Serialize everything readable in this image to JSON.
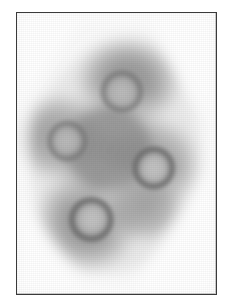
{
  "figure": {
    "domain": "micrograph",
    "caption": "",
    "width": 231,
    "height": 306,
    "page_background": "#ffffff"
  },
  "frame": {
    "border_color": "#3a3a3a",
    "border_width": 1,
    "x": 16,
    "y": 12,
    "width": 201,
    "height": 283,
    "plate_background": "#fafafa"
  },
  "palette": {
    "background": "#fafafa",
    "halo_outer": "#e8e8e8",
    "blob_mid": "#b4b4b4",
    "blob_dark": "#8f8f8f",
    "blob_darkest": "#6f6f6f",
    "ring_rim": "#8a8a8a",
    "ring_core": "#adadad",
    "ring_core_highlight": "#bdbdbd"
  },
  "specimen": {
    "label": "four-particle cluster",
    "blob_lobes": [
      {
        "name": "lobe-top-right",
        "cx": 128,
        "cy": 82,
        "rx": 64,
        "ry": 58
      },
      {
        "name": "lobe-left",
        "cx": 62,
        "cy": 138,
        "rx": 56,
        "ry": 54
      },
      {
        "name": "lobe-right",
        "cx": 152,
        "cy": 164,
        "rx": 56,
        "ry": 56
      },
      {
        "name": "lobe-bottom-left",
        "cx": 88,
        "cy": 220,
        "rx": 62,
        "ry": 62
      },
      {
        "name": "lobe-bridge-center",
        "cx": 110,
        "cy": 150,
        "rx": 72,
        "ry": 66
      }
    ],
    "rings": [
      {
        "name": "ring-top",
        "cx": 123,
        "cy": 92,
        "r_outer": 22,
        "r_inner": 16,
        "intensity": "medium"
      },
      {
        "name": "ring-left",
        "cx": 68,
        "cy": 142,
        "r_outer": 21,
        "r_inner": 15,
        "intensity": "medium"
      },
      {
        "name": "ring-right",
        "cx": 155,
        "cy": 169,
        "r_outer": 22,
        "r_inner": 16,
        "intensity": "strong"
      },
      {
        "name": "ring-bottom",
        "cx": 92,
        "cy": 221,
        "r_outer": 23,
        "r_inner": 17,
        "intensity": "strong"
      }
    ],
    "ring_count": 4
  },
  "chart_data": {
    "type": "heatmap",
    "title": "",
    "xlabel": "",
    "ylabel": "",
    "colormap": "grayscale",
    "value_range": [
      0.26,
      1.0
    ],
    "legend": [],
    "annotations": [],
    "features": [
      {
        "label": "ring-top",
        "x": 123,
        "y": 92,
        "outer_radius": 22,
        "inner_radius": 16,
        "rim_value": 0.54,
        "core_value": 0.68
      },
      {
        "label": "ring-left",
        "x": 68,
        "y": 142,
        "outer_radius": 21,
        "inner_radius": 15,
        "rim_value": 0.55,
        "core_value": 0.69
      },
      {
        "label": "ring-right",
        "x": 155,
        "y": 169,
        "outer_radius": 22,
        "inner_radius": 16,
        "rim_value": 0.5,
        "core_value": 0.7
      },
      {
        "label": "ring-bottom",
        "x": 92,
        "y": 221,
        "outer_radius": 23,
        "inner_radius": 17,
        "rim_value": 0.5,
        "core_value": 0.72
      }
    ]
  }
}
